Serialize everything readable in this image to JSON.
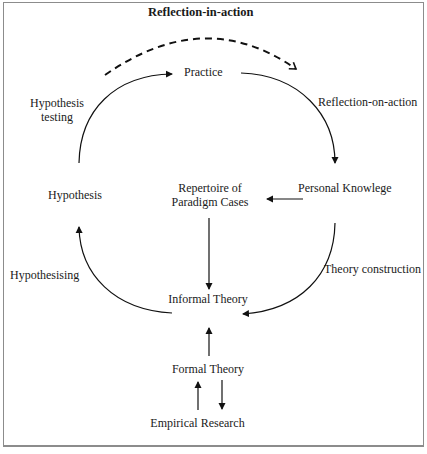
{
  "title": "Reflection-in-action",
  "nodes": {
    "practice": "Practice",
    "personal_knowledge": "Personal Knowlege",
    "repertoire_line1": "Repertoire of",
    "repertoire_line2": "Paradigm Cases",
    "hypothesis": "Hypothesis",
    "informal_theory": "Informal Theory",
    "formal_theory": "Formal Theory",
    "empirical_research": "Empirical Research"
  },
  "edge_labels": {
    "hypothesis_testing_line1": "Hypothesis",
    "hypothesis_testing_line2": "testing",
    "reflection_on_action": "Reflection-on-action",
    "hypothesising": "Hypothesising",
    "theory_construction": "Theory construction"
  },
  "colors": {
    "stroke": "#111111",
    "border": "#8c8c8c",
    "background": "#ffffff"
  }
}
